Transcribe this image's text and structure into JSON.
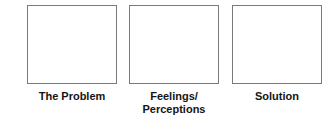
{
  "diagram": {
    "background_color": "#ffffff",
    "box_border_color": "#7a7a7a",
    "box_fill_color": "#ffffff",
    "caption_color": "#141414",
    "columns": [
      {
        "id": "problem",
        "box_label": "",
        "caption": "The Problem"
      },
      {
        "id": "feelings",
        "box_label": "",
        "caption": "Feelings/\nPerceptions"
      },
      {
        "id": "solution",
        "box_label": "",
        "caption": "Solution"
      }
    ]
  }
}
